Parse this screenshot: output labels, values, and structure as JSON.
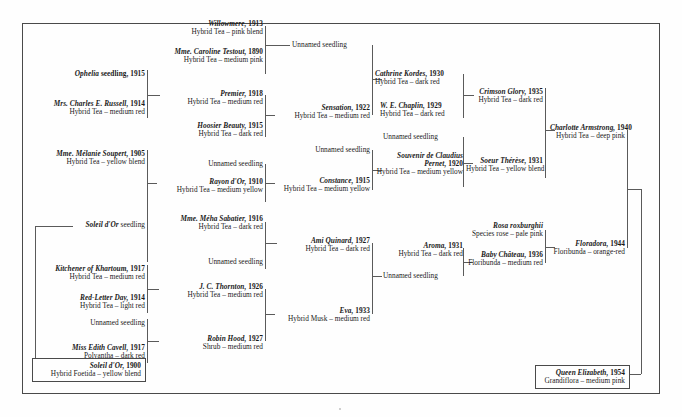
{
  "chart_title": "Pedigree of the rose 'Queen Elizabeth'",
  "colors": {
    "ink": "#1a1a1a",
    "rule": "#5a5a5a",
    "frame": "#4a4a4a",
    "paper": "#fefefe"
  },
  "nodes": {
    "willowmere": {
      "name": "Willowmere,",
      "year": "1913",
      "cls": "Hybrid Tea – pink blend"
    },
    "caroline_testout": {
      "name": "Mme. Caroline Testout,",
      "year": "1890",
      "cls": "Hybrid Tea – medium pink"
    },
    "unnamed_1": {
      "name": "Unnamed seedling",
      "year": "",
      "cls": ""
    },
    "ophelia": {
      "name": "Ophelia",
      "year": "seedling, 1915",
      "cls": ""
    },
    "mrs_russell": {
      "name": "Mrs. Charles E. Russell,",
      "year": "1914",
      "cls": "Hybrid Tea – medium red"
    },
    "premier": {
      "name": "Premier,",
      "year": "1918",
      "cls": "Hybrid Tea – medium red"
    },
    "hoosier_beauty": {
      "name": "Hoosier Beauty,",
      "year": "1915",
      "cls": "Hybrid Tea – dark red"
    },
    "sensation": {
      "name": "Sensation,",
      "year": "1922",
      "cls": "Hybrid Tea – medium red"
    },
    "cathrine_kordes": {
      "name": "Cathrine Kordes,",
      "year": "1930",
      "cls": "Hybrid Tea – dark red"
    },
    "we_chaplin": {
      "name": "W. E. Chaplin,",
      "year": "1929",
      "cls": "Hybrid Tea – dark red"
    },
    "crimson_glory": {
      "name": "Crimson Glory,",
      "year": "1935",
      "cls": "Hybrid Tea – dark red"
    },
    "unnamed_2": {
      "name": "Unnamed seedling",
      "year": "",
      "cls": ""
    },
    "souvenir_pernet": {
      "name": "Souvenir de Claudius Pernet,",
      "year": "1920",
      "cls": "Hybrid Tea – medium yellow"
    },
    "soeur_therese": {
      "name": "Soeur Thérèse,",
      "year": "1931",
      "cls": "Hybrid Tea – yellow blend"
    },
    "charlotte_armstrong": {
      "name": "Charlotte Armstrong,",
      "year": "1940",
      "cls": "Hybrid Tea – deep pink"
    },
    "melanie_soupert": {
      "name": "Mme. Mélanie Soupert,",
      "year": "1905",
      "cls": "Hybrid Tea – yellow blend"
    },
    "unnamed_3": {
      "name": "Unnamed seedling",
      "year": "",
      "cls": ""
    },
    "rayon_dor": {
      "name": "Rayon d'Or,",
      "year": "1910",
      "cls": "Hybrid Tea – medium yellow"
    },
    "constance": {
      "name": "Constance,",
      "year": "1915",
      "cls": "Hybrid Tea – medium yellow"
    },
    "unnamed_4": {
      "name": "Unnamed seedling",
      "year": "",
      "cls": ""
    },
    "soleil_dor_seedling": {
      "name": "Soleil d'Or",
      "year": "seedling",
      "cls": ""
    },
    "meha_sabatier": {
      "name": "Mme. Méha Sabatier,",
      "year": "1916",
      "cls": "Hybrid Tea – dark red"
    },
    "unnamed_5": {
      "name": "Unnamed seedling",
      "year": "",
      "cls": ""
    },
    "ami_quinard": {
      "name": "Ami Quinard,",
      "year": "1927",
      "cls": "Hybrid Tea – dark red"
    },
    "kitchener": {
      "name": "Kitchener of Khartoum,",
      "year": "1917",
      "cls": "Hybrid Tea – medium red"
    },
    "red_letter_day": {
      "name": "Red-Letter Day,",
      "year": "1914",
      "cls": "Hybrid Tea – light red"
    },
    "jc_thornton": {
      "name": "J. C. Thornton,",
      "year": "1926",
      "cls": "Hybrid Tea – medium red"
    },
    "unnamed_6": {
      "name": "Unnamed seedling",
      "year": "",
      "cls": ""
    },
    "miss_edith_cavell": {
      "name": "Miss Edith Cavell,",
      "year": "1917",
      "cls": "Polyantha – dark red"
    },
    "robin_hood": {
      "name": "Robin Hood,",
      "year": "1927",
      "cls": "Shrub – medium red"
    },
    "eva": {
      "name": "Eva,",
      "year": "1933",
      "cls": "Hybrid Musk – medium red"
    },
    "aroma": {
      "name": "Aroma,",
      "year": "1931",
      "cls": "Hybrid Tea – dark red"
    },
    "unnamed_7": {
      "name": "Unnamed seedling",
      "year": "",
      "cls": ""
    },
    "rosa_roxburghii": {
      "name": "Rosa roxburghii",
      "year": "",
      "cls": "Species rose – pale pink"
    },
    "baby_chateau": {
      "name": "Baby Château,",
      "year": "1936",
      "cls": "Floribunda – medium red"
    },
    "floradora": {
      "name": "Floradora,",
      "year": "1944",
      "cls": "Floribunda – orange-red"
    },
    "soleil_dor_1900": {
      "name": "Soleil d'Or,",
      "year": "1900",
      "cls": "Hybrid Foetida – yellow blend"
    },
    "queen_elizabeth": {
      "name": "Queen Elizabeth,",
      "year": "1954",
      "cls": "Grandiflora – medium pink"
    }
  }
}
